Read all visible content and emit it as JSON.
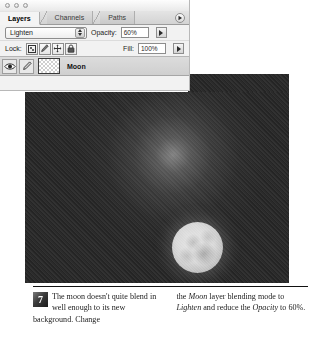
{
  "window": {
    "dots": [
      "close",
      "minimize",
      "zoom"
    ]
  },
  "palette": {
    "tabs": [
      {
        "label": "Layers",
        "active": true
      },
      {
        "label": "Channels",
        "active": false
      },
      {
        "label": "Paths",
        "active": false
      }
    ],
    "menu_button_icon": "palette-menu-arrow-icon",
    "blend_mode": {
      "value": "Lighten",
      "options": [
        "Normal",
        "Dissolve",
        "Darken",
        "Multiply",
        "Color Burn",
        "Linear Burn",
        "Lighten",
        "Screen",
        "Color Dodge",
        "Overlay",
        "Soft Light",
        "Hard Light"
      ]
    },
    "opacity": {
      "label": "Opacity:",
      "value": "60%"
    },
    "lock": {
      "label": "Lock:",
      "icons": [
        {
          "name": "lock-transparent-pixels-icon",
          "glyph": "checker-square"
        },
        {
          "name": "lock-image-pixels-icon",
          "glyph": "brush"
        },
        {
          "name": "lock-position-icon",
          "glyph": "move-cross"
        },
        {
          "name": "lock-all-icon",
          "glyph": "padlock"
        }
      ]
    },
    "fill": {
      "label": "Fill:",
      "value": "100%"
    },
    "layers": [
      {
        "name": "Moon",
        "visible": true,
        "visibility_icon": "eye-icon",
        "edit_icon": "brush-icon",
        "thumbnail": "transparent-checkerboard-thumbnail",
        "selected": true
      }
    ]
  },
  "image": {
    "alt_name": "moon-over-dark-sky-photo",
    "subject": "moon",
    "background": "dark gradient sky with halo glow"
  },
  "caption": {
    "step_number": "7",
    "col1_part1": "The moon doesn't quite blend in well enough to its new background. Change ",
    "col2_part1": "the ",
    "col2_em1": "Moon",
    "col2_part2": " layer blending mode to ",
    "col2_em2": "Lighten",
    "col2_part3": " and reduce the ",
    "col2_em3": "Opacity",
    "col2_part4": " to 60%."
  },
  "colors": {
    "palette_bg": "#f2f2f2",
    "layer_row_bg": "#d5d5d5",
    "image_bg": "#2a2a2a",
    "moon_highlight": "#e8e8e8",
    "text": "#1c1c1c"
  }
}
